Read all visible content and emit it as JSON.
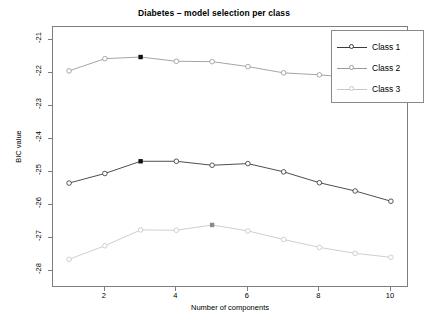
{
  "chart_data": {
    "type": "line",
    "title": "Diabetes – model selection per class",
    "xlabel": "Number of components",
    "ylabel": "BIC value",
    "x": [
      1,
      2,
      3,
      4,
      5,
      6,
      7,
      8,
      9,
      10
    ],
    "xlim": [
      0.55,
      10.45
    ],
    "ylim": [
      -28.45,
      -20.6
    ],
    "xticks": [
      2,
      4,
      6,
      8,
      10
    ],
    "xticklabels": [
      "2",
      "4",
      "6",
      "8",
      "10"
    ],
    "yticks": [
      -21,
      -22,
      -23,
      -24,
      -25,
      -26,
      -27,
      -28
    ],
    "yticklabels": [
      "-21",
      "-22",
      "-23",
      "-24",
      "-25",
      "-26",
      "-27",
      "-28"
    ],
    "grid": false,
    "legend_position": "top-right",
    "marker": "open-circle",
    "highlight_marker": "filled-circle",
    "series": [
      {
        "name": "Class 1",
        "color": "#3a3a3a",
        "values": [
          -25.33,
          -25.04,
          -24.67,
          -24.67,
          -24.79,
          -24.74,
          -24.99,
          -25.32,
          -25.57,
          -25.88
        ],
        "best_x": 3,
        "best_value": -24.67
      },
      {
        "name": "Class 2",
        "color": "#9a9a9a",
        "values": [
          -21.93,
          -21.56,
          -21.51,
          -21.64,
          -21.65,
          -21.8,
          -21.99,
          -22.05,
          -22.14,
          -22.25
        ],
        "best_x": 3,
        "best_value": -21.51
      },
      {
        "name": "Class 3",
        "color": "#c8c8c8",
        "values": [
          -27.64,
          -27.23,
          -26.75,
          -26.76,
          -26.6,
          -26.78,
          -27.04,
          -27.28,
          -27.46,
          -27.58
        ],
        "best_x": 5,
        "best_value": -26.6
      }
    ]
  },
  "legend": {
    "entries": [
      {
        "label": "Class 1"
      },
      {
        "label": "Class 2"
      },
      {
        "label": "Class 3"
      }
    ]
  },
  "colors": {
    "class1": "#3a3a3a",
    "class2": "#9a9a9a",
    "class3": "#c8c8c8",
    "axis": "#7d7d7d",
    "text": "#000000",
    "background": "#ffffff"
  }
}
